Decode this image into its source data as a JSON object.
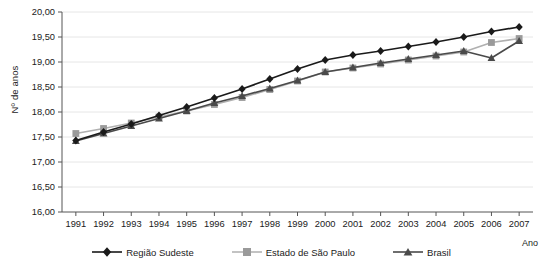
{
  "chart_data": {
    "type": "line",
    "title": "",
    "xlabel": "Ano",
    "ylabel": "Nº de anos",
    "categories": [
      "1991",
      "1992",
      "1993",
      "1994",
      "1995",
      "1996",
      "1997",
      "1998",
      "1999",
      "2000",
      "2001",
      "2002",
      "2003",
      "2004",
      "2005",
      "2006",
      "2007"
    ],
    "ylim": [
      16.0,
      20.0
    ],
    "ytick_labels": [
      "16,00",
      "16,50",
      "17,00",
      "17,50",
      "18,00",
      "18,50",
      "19,00",
      "19,50",
      "20,00"
    ],
    "ytick_values": [
      16.0,
      16.5,
      17.0,
      17.5,
      18.0,
      18.5,
      19.0,
      19.5,
      20.0
    ],
    "grid": true,
    "legend_position": "bottom",
    "series": [
      {
        "name": "Região Sudeste",
        "marker": "diamond",
        "color": "#1a1a1a",
        "values": [
          17.43,
          17.6,
          17.76,
          17.93,
          18.1,
          18.28,
          18.46,
          18.66,
          18.86,
          19.04,
          19.14,
          19.22,
          19.31,
          19.4,
          19.5,
          19.61,
          19.7
        ]
      },
      {
        "name": "Estado de São Paulo",
        "marker": "square",
        "color": "#9a9a9a",
        "values": [
          17.57,
          17.67,
          17.78,
          17.9,
          18.02,
          18.15,
          18.29,
          18.45,
          18.62,
          18.8,
          18.88,
          18.96,
          19.04,
          19.12,
          19.2,
          19.39,
          19.47
        ]
      },
      {
        "name": "Brasil",
        "marker": "triangle",
        "color": "#4a4a4a",
        "values": [
          17.42,
          17.57,
          17.72,
          17.87,
          18.02,
          18.18,
          18.32,
          18.47,
          18.63,
          18.8,
          18.89,
          18.98,
          19.06,
          19.14,
          19.22,
          19.08,
          19.42
        ]
      }
    ]
  },
  "axes": {
    "x_axis_title": "Ano",
    "y_axis_title": "Nº de anos"
  },
  "legend": {
    "items": [
      {
        "label": "Região Sudeste"
      },
      {
        "label": "Estado de São Paulo"
      },
      {
        "label": "Brasil"
      }
    ]
  }
}
